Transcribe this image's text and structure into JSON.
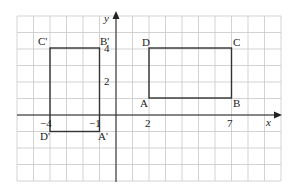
{
  "diagram": {
    "type": "coordinate-grid",
    "grid": {
      "x_min": -6,
      "x_max": 10,
      "y_min": -4,
      "y_max": 6,
      "color": "#c8c8c8"
    },
    "axes": {
      "x_label": "x",
      "y_label": "y",
      "color": "#222222"
    },
    "x_ticks": [
      {
        "value": -4,
        "label": "−4"
      },
      {
        "value": -1,
        "label": "−1"
      },
      {
        "value": 2,
        "label": "2"
      },
      {
        "value": 7,
        "label": "7"
      }
    ],
    "y_ticks": [
      {
        "value": 2,
        "label": "2"
      },
      {
        "value": 4,
        "label": "4"
      }
    ],
    "shapes": [
      {
        "name": "ABCD",
        "points": [
          {
            "label": "A",
            "x": 2,
            "y": 1
          },
          {
            "label": "B",
            "x": 7,
            "y": 1
          },
          {
            "label": "C",
            "x": 7,
            "y": 4
          },
          {
            "label": "D",
            "x": 2,
            "y": 4
          }
        ]
      },
      {
        "name": "A'B'C'D'",
        "points": [
          {
            "label": "A'",
            "x": -1,
            "y": -1
          },
          {
            "label": "B'",
            "x": -1,
            "y": 4
          },
          {
            "label": "C'",
            "x": -4,
            "y": 4
          },
          {
            "label": "D'",
            "x": -4,
            "y": -1
          }
        ]
      }
    ]
  },
  "labels": {
    "x_axis": "x",
    "y_axis": "y",
    "A": "A",
    "B": "B",
    "C": "C",
    "D": "D",
    "A_prime": "A'",
    "B_prime": "B'",
    "C_prime": "C'",
    "D_prime": "D'",
    "tick_x_neg4": "−4",
    "tick_x_neg1": "−1",
    "tick_x_2": "2",
    "tick_x_7": "7",
    "tick_y_2": "2",
    "tick_y_4": "4"
  }
}
